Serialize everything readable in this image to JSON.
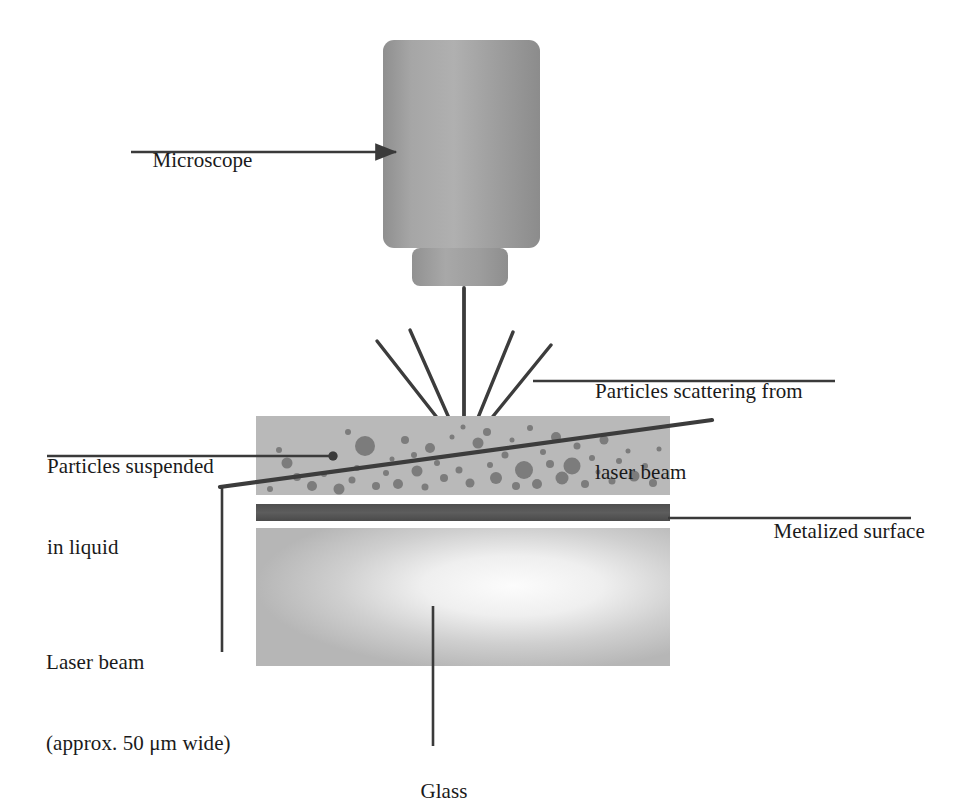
{
  "figure": {
    "type": "labeled-schematic-diagram"
  },
  "labels": {
    "microscope": "Microscope",
    "scattering_line1": "Particles scattering from",
    "scattering_line2": "laser beam",
    "suspended_line1": "Particles suspended",
    "suspended_line2": "in liquid",
    "metalized": "Metalized surface",
    "laser_line1": "Laser beam",
    "laser_line2": "(approx. 50 μm wide)",
    "glass": "Glass"
  },
  "colors": {
    "microscope_body": "#9a9a9a",
    "microscope_body_light": "#adadad",
    "microscope_barrel": "#9c9c9c",
    "liquid_layer": "#b9b9b9",
    "particle": "#7c7c7c",
    "metalized_band": "#575757",
    "glass_block": "#bcbcbc",
    "glass_highlight": "#fbfbfb",
    "line": "#3a3a3a",
    "text": "#1a1a1a",
    "background": "#ffffff"
  },
  "geometry": {
    "microscope_body": {
      "x": 383,
      "y": 40,
      "width": 157,
      "height": 208,
      "radius": 10
    },
    "microscope_barrel": {
      "x": 412,
      "y": 248,
      "width": 96,
      "height": 38,
      "radius": 8
    },
    "liquid_layer": {
      "x": 256,
      "y": 416,
      "width": 414,
      "height": 79
    },
    "metalized_band": {
      "x": 256,
      "y": 504,
      "width": 414,
      "height": 17
    },
    "glass_block": {
      "x": 256,
      "y": 528,
      "width": 414,
      "height": 138
    },
    "scatter_origin": {
      "x": 464,
      "y": 452
    },
    "laser_beam": {
      "x1": 220,
      "y1": 487,
      "x2": 712,
      "y2": 420
    }
  },
  "scatter_rays": [
    {
      "name": "ray-far-left",
      "x2": 377,
      "y2": 341
    },
    {
      "name": "ray-left",
      "x2": 410,
      "y2": 330
    },
    {
      "name": "ray-center-vertical",
      "x2": 464,
      "y2": 288
    },
    {
      "name": "ray-right",
      "x2": 513,
      "y2": 332
    },
    {
      "name": "ray-far-right",
      "x2": 551,
      "y2": 345
    }
  ],
  "leader_lines": {
    "microscope": {
      "x1": 131,
      "y1": 152,
      "x2": 398,
      "y2": 152,
      "arrow": true
    },
    "scattering": {
      "x1": 533,
      "y1": 381,
      "x2": 835,
      "y2": 381
    },
    "suspended": {
      "x1": 47,
      "y1": 456,
      "x2": 333,
      "y2": 456,
      "dot": true
    },
    "metalized": {
      "x1": 668,
      "y1": 518,
      "x2": 911,
      "y2": 518
    },
    "laser": {
      "x1": 222,
      "y1": 487,
      "x2": 222,
      "y2": 652
    },
    "glass": {
      "x1": 433,
      "y1": 606,
      "x2": 433,
      "y2": 746
    }
  },
  "particles": [
    {
      "cx": 287,
      "cy": 463,
      "r": 5.5
    },
    {
      "cx": 279,
      "cy": 450,
      "r": 3.0
    },
    {
      "cx": 297,
      "cy": 477,
      "r": 4.0
    },
    {
      "cx": 312,
      "cy": 486,
      "r": 5.0
    },
    {
      "cx": 324,
      "cy": 474,
      "r": 3.0
    },
    {
      "cx": 333,
      "cy": 456,
      "r": 4.5
    },
    {
      "cx": 339,
      "cy": 489,
      "r": 5.5
    },
    {
      "cx": 352,
      "cy": 480,
      "r": 3.5
    },
    {
      "cx": 365,
      "cy": 446,
      "r": 10.0
    },
    {
      "cx": 357,
      "cy": 468,
      "r": 3.0
    },
    {
      "cx": 376,
      "cy": 486,
      "r": 4.0
    },
    {
      "cx": 386,
      "cy": 473,
      "r": 3.0
    },
    {
      "cx": 392,
      "cy": 459,
      "r": 2.5
    },
    {
      "cx": 398,
      "cy": 484,
      "r": 5.0
    },
    {
      "cx": 405,
      "cy": 440,
      "r": 4.0
    },
    {
      "cx": 414,
      "cy": 455,
      "r": 3.0
    },
    {
      "cx": 417,
      "cy": 471,
      "r": 5.5
    },
    {
      "cx": 425,
      "cy": 487,
      "r": 3.5
    },
    {
      "cx": 430,
      "cy": 448,
      "r": 5.0
    },
    {
      "cx": 437,
      "cy": 463,
      "r": 3.0
    },
    {
      "cx": 444,
      "cy": 478,
      "r": 4.0
    },
    {
      "cx": 452,
      "cy": 437,
      "r": 2.5
    },
    {
      "cx": 459,
      "cy": 470,
      "r": 3.5
    },
    {
      "cx": 470,
      "cy": 483,
      "r": 4.5
    },
    {
      "cx": 478,
      "cy": 443,
      "r": 5.5
    },
    {
      "cx": 487,
      "cy": 432,
      "r": 4.0
    },
    {
      "cx": 490,
      "cy": 465,
      "r": 3.0
    },
    {
      "cx": 496,
      "cy": 478,
      "r": 6.0
    },
    {
      "cx": 505,
      "cy": 455,
      "r": 3.5
    },
    {
      "cx": 512,
      "cy": 440,
      "r": 2.5
    },
    {
      "cx": 516,
      "cy": 486,
      "r": 4.0
    },
    {
      "cx": 524,
      "cy": 470,
      "r": 9.0
    },
    {
      "cx": 537,
      "cy": 484,
      "r": 5.0
    },
    {
      "cx": 543,
      "cy": 452,
      "r": 3.0
    },
    {
      "cx": 550,
      "cy": 464,
      "r": 4.0
    },
    {
      "cx": 556,
      "cy": 437,
      "r": 5.0
    },
    {
      "cx": 562,
      "cy": 478,
      "r": 6.5
    },
    {
      "cx": 572,
      "cy": 466,
      "r": 8.5
    },
    {
      "cx": 577,
      "cy": 446,
      "r": 3.5
    },
    {
      "cx": 585,
      "cy": 484,
      "r": 4.0
    },
    {
      "cx": 592,
      "cy": 458,
      "r": 3.0
    },
    {
      "cx": 598,
      "cy": 472,
      "r": 2.5
    },
    {
      "cx": 604,
      "cy": 440,
      "r": 4.5
    },
    {
      "cx": 612,
      "cy": 481,
      "r": 3.5
    },
    {
      "cx": 619,
      "cy": 461,
      "r": 3.0
    },
    {
      "cx": 628,
      "cy": 451,
      "r": 2.5
    },
    {
      "cx": 634,
      "cy": 476,
      "r": 5.5
    },
    {
      "cx": 645,
      "cy": 466,
      "r": 3.0
    },
    {
      "cx": 653,
      "cy": 483,
      "r": 4.0
    },
    {
      "cx": 659,
      "cy": 449,
      "r": 2.5
    },
    {
      "cx": 270,
      "cy": 489,
      "r": 3.0
    },
    {
      "cx": 348,
      "cy": 432,
      "r": 3.0
    },
    {
      "cx": 463,
      "cy": 427,
      "r": 2.5
    },
    {
      "cx": 530,
      "cy": 428,
      "r": 3.0
    }
  ],
  "label_positions": {
    "microscope": {
      "left": 131,
      "top": 122,
      "align": "left"
    },
    "scattering": {
      "left": 595,
      "top": 323,
      "align": "left"
    },
    "suspended": {
      "left": 47,
      "top": 398,
      "align": "left"
    },
    "metalized": {
      "left": 752,
      "top": 488,
      "align": "left"
    },
    "laser": {
      "left": 46,
      "top": 594,
      "align": "left"
    },
    "glass": {
      "left": 398,
      "top": 752,
      "align": "left"
    }
  }
}
